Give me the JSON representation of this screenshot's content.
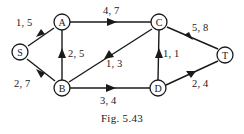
{
  "figure": {
    "caption": "Fig. 5.43"
  },
  "graph": {
    "type": "directed-network",
    "nodes": [
      {
        "id": "S",
        "label": "S",
        "x": 20,
        "y": 52
      },
      {
        "id": "A",
        "label": "A",
        "x": 62,
        "y": 22
      },
      {
        "id": "B",
        "label": "B",
        "x": 62,
        "y": 88
      },
      {
        "id": "C",
        "label": "C",
        "x": 159,
        "y": 22
      },
      {
        "id": "D",
        "label": "D",
        "x": 158,
        "y": 88
      },
      {
        "id": "T",
        "label": "T",
        "x": 225,
        "y": 55
      }
    ],
    "edges": [
      {
        "from": "S",
        "to": "A",
        "label": "1, 5",
        "capacity": 1,
        "cost": 5,
        "label_x": 16,
        "label_y": 17
      },
      {
        "from": "S",
        "to": "B",
        "label": "2, 7",
        "capacity": 2,
        "cost": 7,
        "label_x": 14,
        "label_y": 78
      },
      {
        "from": "B",
        "to": "A",
        "label": "2, 5",
        "capacity": 2,
        "cost": 5,
        "label_x": 68,
        "label_y": 48
      },
      {
        "from": "A",
        "to": "C",
        "label": "4, 7",
        "capacity": 4,
        "cost": 7,
        "label_x": 103,
        "label_y": 5
      },
      {
        "from": "C",
        "to": "B",
        "label": "1, 3",
        "capacity": 1,
        "cost": 3,
        "label_x": 106,
        "label_y": 58
      },
      {
        "from": "B",
        "to": "D",
        "label": "3, 4",
        "capacity": 3,
        "cost": 4,
        "label_x": 100,
        "label_y": 95
      },
      {
        "from": "D",
        "to": "C",
        "label": "1, 1",
        "capacity": 1,
        "cost": 1,
        "label_x": 163,
        "label_y": 48
      },
      {
        "from": "D",
        "to": "T",
        "label": "2, 4",
        "capacity": 2,
        "cost": 4,
        "label_x": 192,
        "label_y": 78
      },
      {
        "from": "T",
        "to": "C",
        "label": "5, 8",
        "capacity": 5,
        "cost": 8,
        "label_x": 192,
        "label_y": 22
      }
    ]
  }
}
